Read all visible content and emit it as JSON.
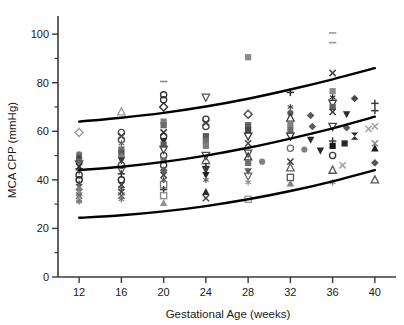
{
  "chart_data": {
    "type": "scatter",
    "title": "",
    "xlabel": "Gestational Age (weeks)",
    "ylabel": "MCA CPP (mmHg)",
    "xlim": [
      10,
      42
    ],
    "ylim": [
      0,
      105
    ],
    "xticks": [
      12,
      16,
      20,
      24,
      28,
      32,
      36,
      40
    ],
    "xtick_labels": [
      "12",
      "16",
      "20",
      "24",
      "28",
      "32",
      "36",
      "40"
    ],
    "yticks": [
      0,
      20,
      40,
      60,
      80,
      100
    ],
    "ytick_labels": [
      "0",
      "20",
      "40",
      "60",
      "80",
      "100"
    ],
    "yminorticks": [
      10,
      30,
      50,
      70,
      90
    ],
    "grid": false,
    "legend": "none",
    "marker_color_dark": "#1a1a1a",
    "marker_color_mid": "#808080",
    "marker_color_light": "#b8b8b8",
    "curve_color": "#000000",
    "axis_color": "#3a3a3a",
    "curves": [
      {
        "name": "upper-percentile-curve",
        "x": [
          12,
          16,
          20,
          24,
          28,
          32,
          36,
          40
        ],
        "y": [
          64.0,
          65.6,
          67.6,
          70.2,
          73.4,
          77.2,
          81.4,
          86.0
        ]
      },
      {
        "name": "median-curve",
        "x": [
          12,
          16,
          20,
          24,
          28,
          32,
          36,
          40
        ],
        "y": [
          44.0,
          45.4,
          47.4,
          50.0,
          53.2,
          57.0,
          61.2,
          66.0
        ]
      },
      {
        "name": "lower-percentile-curve",
        "x": [
          12,
          16,
          20,
          24,
          28,
          32,
          36,
          40
        ],
        "y": [
          24.4,
          25.4,
          27.0,
          29.2,
          32.0,
          35.4,
          39.4,
          44.0
        ]
      }
    ],
    "points": [
      {
        "x": 12,
        "y": 59.5,
        "m": "diamond-open",
        "c": "#9a9a9a"
      },
      {
        "x": 12,
        "y": 50.5,
        "m": "circle-filled",
        "c": "#707070"
      },
      {
        "x": 12,
        "y": 49.0,
        "m": "circle-filled",
        "c": "#4a4a4a"
      },
      {
        "x": 12,
        "y": 47.5,
        "m": "square-filled",
        "c": "#6a6a6a"
      },
      {
        "x": 12,
        "y": 46.5,
        "m": "triangle-down-open",
        "c": "#555555"
      },
      {
        "x": 12,
        "y": 45.5,
        "m": "x-mark",
        "c": "#3a3a3a"
      },
      {
        "x": 12,
        "y": 44.5,
        "m": "plus-mark",
        "c": "#2a2a2a"
      },
      {
        "x": 12,
        "y": 43.5,
        "m": "asterisk",
        "c": "#5a5a5a"
      },
      {
        "x": 12,
        "y": 42.0,
        "m": "circle-open",
        "c": "#333333"
      },
      {
        "x": 12,
        "y": 40.0,
        "m": "circle-open",
        "c": "#222222"
      },
      {
        "x": 12,
        "y": 38.5,
        "m": "asterisk",
        "c": "#444444"
      },
      {
        "x": 12,
        "y": 37.0,
        "m": "x-mark",
        "c": "#555555"
      },
      {
        "x": 12,
        "y": 36.0,
        "m": "diamond-filled",
        "c": "#7a7a7a"
      },
      {
        "x": 12,
        "y": 34.5,
        "m": "triangle-up-filled",
        "c": "#8a8a8a"
      },
      {
        "x": 12,
        "y": 33.5,
        "m": "x-mark",
        "c": "#666666"
      },
      {
        "x": 12,
        "y": 32.0,
        "m": "triangle-up-filled",
        "c": "#9a9a9a"
      },
      {
        "x": 12,
        "y": 31.0,
        "m": "asterisk",
        "c": "#777777"
      },
      {
        "x": 16,
        "y": 68.0,
        "m": "triangle-up-open",
        "c": "#9a9a9a"
      },
      {
        "x": 16,
        "y": 59.5,
        "m": "circle-open",
        "c": "#4a4a4a"
      },
      {
        "x": 16,
        "y": 58.0,
        "m": "x-mark",
        "c": "#3a3a3a"
      },
      {
        "x": 16,
        "y": 56.5,
        "m": "circle-open",
        "c": "#555555"
      },
      {
        "x": 16,
        "y": 55.0,
        "m": "asterisk",
        "c": "#666666"
      },
      {
        "x": 16,
        "y": 52.5,
        "m": "square-filled",
        "c": "#707070"
      },
      {
        "x": 16,
        "y": 51.0,
        "m": "square-filled",
        "c": "#5a5a5a"
      },
      {
        "x": 16,
        "y": 49.5,
        "m": "diamond-filled",
        "c": "#808080"
      },
      {
        "x": 16,
        "y": 48.0,
        "m": "triangle-down-filled",
        "c": "#3a3a3a"
      },
      {
        "x": 16,
        "y": 46.0,
        "m": "circle-open",
        "c": "#444444"
      },
      {
        "x": 16,
        "y": 44.0,
        "m": "triangle-down-open",
        "c": "#666666"
      },
      {
        "x": 16,
        "y": 42.5,
        "m": "plus-mark",
        "c": "#333333"
      },
      {
        "x": 16,
        "y": 40.0,
        "m": "circle-open",
        "c": "#2a2a2a"
      },
      {
        "x": 16,
        "y": 38.0,
        "m": "x-mark",
        "c": "#3a3a3a"
      },
      {
        "x": 16,
        "y": 36.5,
        "m": "asterisk",
        "c": "#555555"
      },
      {
        "x": 16,
        "y": 35.0,
        "m": "x-mark",
        "c": "#444444"
      },
      {
        "x": 16,
        "y": 33.5,
        "m": "x-mark",
        "c": "#606060"
      },
      {
        "x": 16,
        "y": 32.0,
        "m": "asterisk",
        "c": "#707070"
      },
      {
        "x": 20,
        "y": 80.5,
        "m": "dash-mark",
        "c": "#8a8a8a"
      },
      {
        "x": 20,
        "y": 75.0,
        "m": "circle-open",
        "c": "#333333"
      },
      {
        "x": 20,
        "y": 73.0,
        "m": "circle-open",
        "c": "#333333"
      },
      {
        "x": 20,
        "y": 70.0,
        "m": "diamond-open",
        "c": "#2a2a2a"
      },
      {
        "x": 20,
        "y": 64.0,
        "m": "square-filled",
        "c": "#808080"
      },
      {
        "x": 20,
        "y": 62.5,
        "m": "square-filled",
        "c": "#6a6a6a"
      },
      {
        "x": 20,
        "y": 59.5,
        "m": "x-mark",
        "c": "#333333"
      },
      {
        "x": 20,
        "y": 58.0,
        "m": "circle-open",
        "c": "#3a3a3a"
      },
      {
        "x": 20,
        "y": 56.0,
        "m": "triangle-down-filled",
        "c": "#2a2a2a"
      },
      {
        "x": 20,
        "y": 54.5,
        "m": "square-filled",
        "c": "#5a5a5a"
      },
      {
        "x": 20,
        "y": 52.5,
        "m": "triangle-down-open",
        "c": "#4a4a4a"
      },
      {
        "x": 20,
        "y": 50.0,
        "m": "circle-open",
        "c": "#444444"
      },
      {
        "x": 20,
        "y": 48.0,
        "m": "square-filled",
        "c": "#707070"
      },
      {
        "x": 20,
        "y": 46.0,
        "m": "circle-open",
        "c": "#3a3a3a"
      },
      {
        "x": 20,
        "y": 44.0,
        "m": "diamond-filled",
        "c": "#606060"
      },
      {
        "x": 20,
        "y": 42.0,
        "m": "x-mark",
        "c": "#444444"
      },
      {
        "x": 20,
        "y": 40.0,
        "m": "asterisk",
        "c": "#555555"
      },
      {
        "x": 20,
        "y": 38.0,
        "m": "square-open",
        "c": "#777777"
      },
      {
        "x": 20,
        "y": 36.0,
        "m": "plus-mark",
        "c": "#3a3a3a"
      },
      {
        "x": 20,
        "y": 33.5,
        "m": "square-open",
        "c": "#888888"
      },
      {
        "x": 20,
        "y": 30.5,
        "m": "triangle-up-filled",
        "c": "#909090"
      },
      {
        "x": 24,
        "y": 74.0,
        "m": "triangle-down-open",
        "c": "#555555"
      },
      {
        "x": 24,
        "y": 65.0,
        "m": "circle-open",
        "c": "#333333"
      },
      {
        "x": 24,
        "y": 63.5,
        "m": "x-mark",
        "c": "#3a3a3a"
      },
      {
        "x": 24,
        "y": 62.0,
        "m": "circle-open",
        "c": "#444444"
      },
      {
        "x": 24,
        "y": 58.0,
        "m": "square-filled",
        "c": "#5a5a5a"
      },
      {
        "x": 24,
        "y": 56.0,
        "m": "square-filled",
        "c": "#707070"
      },
      {
        "x": 24,
        "y": 54.0,
        "m": "square-filled",
        "c": "#808080"
      },
      {
        "x": 24,
        "y": 50.0,
        "m": "triangle-down-open",
        "c": "#4a4a4a"
      },
      {
        "x": 24,
        "y": 48.0,
        "m": "triangle-up-open",
        "c": "#555555"
      },
      {
        "x": 24,
        "y": 45.5,
        "m": "plus-mark",
        "c": "#2a2a2a"
      },
      {
        "x": 24,
        "y": 44.0,
        "m": "triangle-down-filled",
        "c": "#3a3a3a"
      },
      {
        "x": 24,
        "y": 42.0,
        "m": "triangle-down-filled",
        "c": "#222222"
      },
      {
        "x": 24,
        "y": 40.0,
        "m": "asterisk",
        "c": "#606060"
      },
      {
        "x": 24,
        "y": 35.0,
        "m": "triangle-up-filled",
        "c": "#2a2a2a"
      },
      {
        "x": 24,
        "y": 32.5,
        "m": "x-mark",
        "c": "#444444"
      },
      {
        "x": 28,
        "y": 90.5,
        "m": "square-filled",
        "c": "#8a8a8a"
      },
      {
        "x": 28,
        "y": 67.0,
        "m": "diamond-open",
        "c": "#444444"
      },
      {
        "x": 28,
        "y": 62.5,
        "m": "square-filled",
        "c": "#606060"
      },
      {
        "x": 28,
        "y": 60.5,
        "m": "square-filled",
        "c": "#4a4a4a"
      },
      {
        "x": 28,
        "y": 58.0,
        "m": "triangle-down-open",
        "c": "#3a3a3a"
      },
      {
        "x": 28,
        "y": 55.0,
        "m": "x-mark",
        "c": "#444444"
      },
      {
        "x": 28,
        "y": 51.0,
        "m": "triangle-down-open",
        "c": "#555555"
      },
      {
        "x": 28,
        "y": 49.5,
        "m": "triangle-up-open",
        "c": "#3a3a3a"
      },
      {
        "x": 28,
        "y": 47.0,
        "m": "square-filled",
        "c": "#707070"
      },
      {
        "x": 28,
        "y": 47.5,
        "m": "circle-filled",
        "c": "#808080",
        "dx": 14
      },
      {
        "x": 28,
        "y": 43.5,
        "m": "triangle-down-filled",
        "c": "#5a5a5a"
      },
      {
        "x": 28,
        "y": 41.5,
        "m": "triangle-down-open",
        "c": "#666666"
      },
      {
        "x": 28,
        "y": 39.0,
        "m": "asterisk",
        "c": "#909090"
      },
      {
        "x": 28,
        "y": 32.0,
        "m": "square-open",
        "c": "#9a9a9a"
      },
      {
        "x": 32,
        "y": 76.0,
        "m": "plus-mark",
        "c": "#2a2a2a"
      },
      {
        "x": 32,
        "y": 70.0,
        "m": "asterisk",
        "c": "#4a4a4a"
      },
      {
        "x": 32,
        "y": 67.5,
        "m": "circle-filled",
        "c": "#5a5a5a"
      },
      {
        "x": 32,
        "y": 65.5,
        "m": "triangle-up-open",
        "c": "#3a3a3a"
      },
      {
        "x": 32,
        "y": 63.0,
        "m": "square-filled",
        "c": "#808080"
      },
      {
        "x": 32,
        "y": 62.0,
        "m": "diamond-filled",
        "c": "#5a5a5a",
        "dx": 22
      },
      {
        "x": 32,
        "y": 60.5,
        "m": "square-filled",
        "c": "#707070"
      },
      {
        "x": 32,
        "y": 58.0,
        "m": "triangle-down-open",
        "c": "#3a3a3a"
      },
      {
        "x": 32,
        "y": 53.0,
        "m": "circle-open",
        "c": "#707070"
      },
      {
        "x": 32,
        "y": 52.5,
        "m": "circle-filled",
        "c": "#808080",
        "dx": 14
      },
      {
        "x": 32,
        "y": 52.0,
        "m": "triangle-down-filled",
        "c": "#2a2a2a",
        "dx": 30
      },
      {
        "x": 32,
        "y": 47.5,
        "m": "x-mark",
        "c": "#3a3a3a"
      },
      {
        "x": 32,
        "y": 45.0,
        "m": "triangle-up-open",
        "c": "#606060"
      },
      {
        "x": 32,
        "y": 41.0,
        "m": "square-open",
        "c": "#555555"
      },
      {
        "x": 32,
        "y": 38.5,
        "m": "triangle-up-filled",
        "c": "#808080"
      },
      {
        "x": 36,
        "y": 100.5,
        "m": "dash-mark",
        "c": "#9a9a9a"
      },
      {
        "x": 36,
        "y": 96.5,
        "m": "dash-mark",
        "c": "#9a9a9a"
      },
      {
        "x": 36,
        "y": 84.0,
        "m": "x-mark",
        "c": "#444444"
      },
      {
        "x": 36,
        "y": 76.5,
        "m": "square-filled",
        "c": "#8a8a8a"
      },
      {
        "x": 36,
        "y": 74.0,
        "m": "asterisk",
        "c": "#2a2a2a"
      },
      {
        "x": 36,
        "y": 73.5,
        "m": "diamond-filled",
        "c": "#4a4a4a",
        "dx": 22
      },
      {
        "x": 36,
        "y": 71.5,
        "m": "triangle-down-open",
        "c": "#3a3a3a"
      },
      {
        "x": 36,
        "y": 70.0,
        "m": "square-filled",
        "c": "#606060"
      },
      {
        "x": 36,
        "y": 68.0,
        "m": "x-mark",
        "c": "#3a3a3a"
      },
      {
        "x": 36,
        "y": 67.0,
        "m": "triangle-down-filled",
        "c": "#2a2a2a",
        "dx": 14
      },
      {
        "x": 36,
        "y": 66.5,
        "m": "diamond-filled",
        "c": "#5a5a5a",
        "dx": -22
      },
      {
        "x": 36,
        "y": 62.0,
        "m": "triangle-down-open",
        "c": "#444444"
      },
      {
        "x": 36,
        "y": 61.5,
        "m": "diamond-filled",
        "c": "#5a5a5a",
        "dx": 14
      },
      {
        "x": 36,
        "y": 61.0,
        "m": "x-mark",
        "c": "#a0a0a0",
        "dx": 36
      },
      {
        "x": 36,
        "y": 58.0,
        "m": "hourglass-filled",
        "c": "#2a2a2a",
        "dx": 22
      },
      {
        "x": 36,
        "y": 56.5,
        "m": "triangle-down-filled",
        "c": "#2a2a2a",
        "dx": -22
      },
      {
        "x": 36,
        "y": 56.0,
        "m": "plus-mark",
        "c": "#3a3a3a"
      },
      {
        "x": 36,
        "y": 55.0,
        "m": "square-filled",
        "c": "#2a2a2a",
        "dx": 12
      },
      {
        "x": 36,
        "y": 54.0,
        "m": "square-filled",
        "c": "#1a1a1a"
      },
      {
        "x": 36,
        "y": 50.0,
        "m": "circle-open",
        "c": "#3a3a3a"
      },
      {
        "x": 36,
        "y": 46.0,
        "m": "x-mark",
        "c": "#a0a0a0",
        "dx": 10
      },
      {
        "x": 36,
        "y": 44.0,
        "m": "triangle-up-open",
        "c": "#555555"
      },
      {
        "x": 36,
        "y": 39.0,
        "m": "asterisk",
        "c": "#808080"
      },
      {
        "x": 40,
        "y": 71.5,
        "m": "plus-mark",
        "c": "#3a3a3a"
      },
      {
        "x": 40,
        "y": 68.5,
        "m": "plus-mark",
        "c": "#3a3a3a"
      },
      {
        "x": 40,
        "y": 62.0,
        "m": "x-mark",
        "c": "#a0a0a0"
      },
      {
        "x": 40,
        "y": 55.0,
        "m": "x-mark",
        "c": "#888888"
      },
      {
        "x": 40,
        "y": 53.0,
        "m": "triangle-up-filled",
        "c": "#1a1a1a"
      },
      {
        "x": 40,
        "y": 47.0,
        "m": "diamond-filled",
        "c": "#555555"
      },
      {
        "x": 40,
        "y": 40.0,
        "m": "triangle-up-open",
        "c": "#555555"
      }
    ]
  },
  "axes": {
    "ylabel": "MCA CPP (mmHg)",
    "xlabel": "Gestational Age (weeks)"
  }
}
